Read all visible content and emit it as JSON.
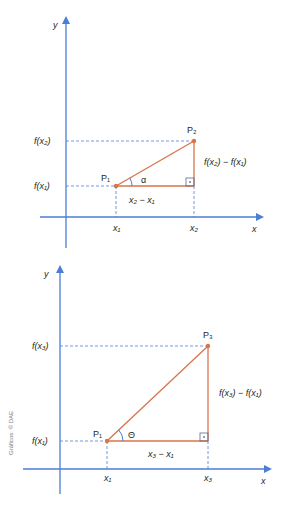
{
  "colors": {
    "axis": "#4a7fd4",
    "triangle": "#d9734a",
    "dashed": "#4a7fd4",
    "point": "#d9734a",
    "text": "#231f20",
    "right_angle_box": "#5b6b8a"
  },
  "diagram_top": {
    "y_axis_label": "y",
    "x_axis_label": "x",
    "y_ticks": [
      "f(x₂)",
      "f(x₁)"
    ],
    "x_ticks": [
      "x₁",
      "x₂"
    ],
    "points": [
      "P₁",
      "P₂"
    ],
    "angle_label": "α",
    "horizontal_leg_label": "x₂ − x₁",
    "vertical_leg_label": "f(x₂) − f(x₁)"
  },
  "diagram_bottom": {
    "y_axis_label": "y",
    "x_axis_label": "x",
    "y_ticks": [
      "f(x₃)",
      "f(x₁)"
    ],
    "x_ticks": [
      "x₁",
      "x₃"
    ],
    "points": [
      "P₁",
      "P₃"
    ],
    "angle_label": "Θ",
    "horizontal_leg_label": "x₃ − x₁",
    "vertical_leg_label": "f(x₃) − f(x₁)"
  },
  "credit": "Gráficos: © DAE"
}
